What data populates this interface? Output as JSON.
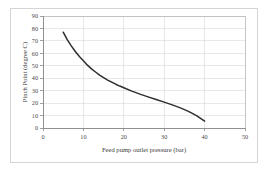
{
  "chart_data": {
    "type": "line",
    "title": "",
    "xlabel": "Feed pump outlet pressure (bar)",
    "ylabel": "Pinch Point (degree C)",
    "xlim": [
      0,
      50
    ],
    "ylim": [
      0,
      90
    ],
    "xticks": [
      0,
      10,
      20,
      30,
      40,
      50
    ],
    "yticks": [
      0,
      10,
      20,
      30,
      40,
      50,
      60,
      70,
      80,
      90
    ],
    "grid": "both",
    "legend": "none",
    "series": [
      {
        "name": "Pinch Point",
        "color": "#2e2e2e",
        "x": [
          5,
          6,
          7,
          8,
          9,
          10,
          11,
          12,
          13,
          14,
          15,
          16,
          17,
          18,
          19,
          20,
          22,
          24,
          26,
          28,
          30,
          32,
          34,
          36,
          38,
          40
        ],
        "values": [
          77,
          71,
          66,
          61.5,
          57.5,
          54,
          50.5,
          47.5,
          45,
          42.5,
          40.5,
          38.5,
          36.8,
          35.2,
          33.7,
          32.3,
          29.6,
          27.2,
          25,
          22.9,
          20.8,
          18.6,
          16.2,
          13.4,
          9.9,
          5.5
        ]
      }
    ]
  },
  "axes": {
    "y_tick_labels": [
      "0",
      "10",
      "20",
      "30",
      "40",
      "50",
      "60",
      "70",
      "80",
      "90"
    ],
    "x_tick_labels": [
      "0",
      "10",
      "20",
      "30",
      "40",
      "50"
    ],
    "x_title": "Feed pump outlet pressure (bar)",
    "y_title": "Pinch Point (degree C)"
  },
  "colors": {
    "curve": "#2e2e2e",
    "grid": "#d9d9d9",
    "frame": "#b8b8b8",
    "outer_border": "#d5d5d5",
    "background": "#ffffff"
  }
}
